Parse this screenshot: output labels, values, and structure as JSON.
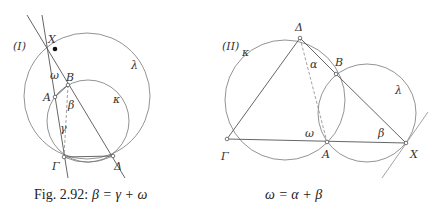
{
  "figure_I": {
    "label": "(I)",
    "points": {
      "X": "X",
      "A": "A",
      "B": "B",
      "Gamma": "Γ",
      "Delta": "Δ"
    },
    "circles": {
      "lambda": "λ",
      "kappa": "κ"
    },
    "angles": {
      "omega": "ω",
      "beta": "β",
      "gamma": "γ"
    }
  },
  "figure_II": {
    "label": "(II)",
    "points": {
      "Delta": "Δ",
      "B": "B",
      "A": "A",
      "Gamma": "Γ",
      "X": "X"
    },
    "circles": {
      "kappa": "κ",
      "lambda": "λ"
    },
    "angles": {
      "alpha": "α",
      "omega": "ω",
      "beta": "β"
    }
  },
  "caption": {
    "fig_label": "Fig. 2.92:",
    "eq1": "β = γ + ω",
    "eq2": "ω = α + β"
  }
}
